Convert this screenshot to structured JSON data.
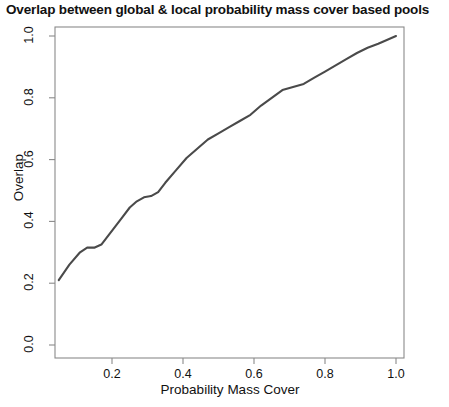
{
  "chart_data": {
    "type": "line",
    "title": "Overlap between global & local probability mass cover based pools",
    "xlabel": "Probability Mass Cover",
    "ylabel": "Overlap",
    "xlim": [
      0.0,
      1.05
    ],
    "ylim": [
      0.0,
      1.0
    ],
    "grid": false,
    "legend": null,
    "xticks": [
      "0.2",
      "0.4",
      "0.6",
      "0.8",
      "1.0"
    ],
    "xtick_values": [
      0.2,
      0.4,
      0.6,
      0.8,
      1.0
    ],
    "yticks": [
      "0.0",
      "0.2",
      "0.4",
      "0.6",
      "0.8",
      "1.0"
    ],
    "ytick_values": [
      0.0,
      0.2,
      0.4,
      0.6,
      0.8,
      1.0
    ],
    "line_color": "#4a4a4a",
    "line_width": 2.1,
    "series": [
      {
        "name": "Overlap",
        "x": [
          0.05,
          0.08,
          0.11,
          0.13,
          0.15,
          0.17,
          0.19,
          0.21,
          0.23,
          0.25,
          0.27,
          0.29,
          0.31,
          0.33,
          0.35,
          0.38,
          0.41,
          0.44,
          0.47,
          0.5,
          0.53,
          0.56,
          0.59,
          0.62,
          0.65,
          0.68,
          0.71,
          0.74,
          0.77,
          0.8,
          0.83,
          0.86,
          0.89,
          0.92,
          0.95,
          1.0
        ],
        "y": [
          0.21,
          0.26,
          0.3,
          0.315,
          0.315,
          0.325,
          0.355,
          0.385,
          0.415,
          0.445,
          0.465,
          0.478,
          0.482,
          0.495,
          0.525,
          0.565,
          0.605,
          0.635,
          0.665,
          0.685,
          0.705,
          0.725,
          0.745,
          0.775,
          0.8,
          0.825,
          0.835,
          0.845,
          0.865,
          0.885,
          0.905,
          0.925,
          0.945,
          0.962,
          0.975,
          1.0
        ]
      }
    ]
  }
}
